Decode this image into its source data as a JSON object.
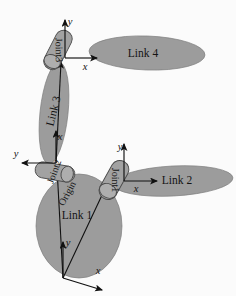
{
  "figure": {
    "kind": "kinematic-chain-diagram",
    "background_color": "#fbfbfb",
    "body_fill_color": "#9c9c9c",
    "joint_fill_color": "#a2a2a2",
    "outline_color": "#4a4a4a",
    "text_color": "#141414"
  },
  "links": [
    {
      "id": "link1",
      "label": "Link 1",
      "shape": "ellipse",
      "cx": 79,
      "cy": 226,
      "rx": 43,
      "ry": 52,
      "rotation": 0,
      "label_x": 77,
      "label_y": 219,
      "label_rotation": 0
    },
    {
      "id": "link2",
      "label": "Link 2",
      "shape": "ellipse",
      "cx": 173,
      "cy": 181,
      "rx": 60,
      "ry": 15,
      "rotation": -3,
      "label_x": 177,
      "label_y": 184,
      "label_rotation": 0
    },
    {
      "id": "link3",
      "label": "Link 3",
      "shape": "ellipse",
      "cx": 54,
      "cy": 113,
      "rx": 14,
      "ry": 51,
      "rotation": 6,
      "label_x": 57,
      "label_y": 112,
      "label_rotation": -76
    },
    {
      "id": "link4",
      "label": "Link 4",
      "shape": "ellipse",
      "cx": 147,
      "cy": 53,
      "rx": 58,
      "ry": 17,
      "rotation": 2,
      "label_x": 143,
      "label_y": 57,
      "label_rotation": 0
    }
  ],
  "joints": [
    {
      "id": "joint1",
      "label": "Joint1",
      "cx": 114,
      "cy": 180,
      "width": 18,
      "height": 42,
      "rotation": 29,
      "label_rotation": 61
    },
    {
      "id": "joint2",
      "label": "Joint2",
      "cx": 55,
      "cy": 172,
      "width": 16,
      "height": 40,
      "rotation": -80,
      "label_rotation": 10
    },
    {
      "id": "joint3",
      "label": "Joint3",
      "cx": 58,
      "cy": 50,
      "width": 17,
      "height": 42,
      "rotation": 27,
      "label_rotation": 62
    }
  ],
  "frames": [
    {
      "id": "base-frame",
      "origin_x": 63,
      "origin_y": 278,
      "x_axis": {
        "label": "x",
        "dx": 39,
        "dy": 12,
        "label_x": 98,
        "label_y": 274
      },
      "y_axis": {
        "label": "y",
        "dx": 0,
        "dy": -36,
        "label_x": 68,
        "label_y": 246
      }
    },
    {
      "id": "joint1-frame",
      "origin_x": 124,
      "origin_y": 181,
      "x_axis": {
        "label": "x",
        "dx": 33,
        "dy": 0,
        "label_x": 136,
        "label_y": 192
      },
      "y_axis": {
        "label": "y",
        "dx": 0,
        "dy": -37,
        "label_x": 120,
        "label_y": 150
      }
    },
    {
      "id": "joint2-frame",
      "origin_x": 56,
      "origin_y": 163,
      "x_axis": {
        "label": "x",
        "dx": 0,
        "dy": -32,
        "label_x": 60,
        "label_y": 140
      },
      "y_axis": {
        "label": "y",
        "dx": -34,
        "dy": 0,
        "label_x": 16,
        "label_y": 157
      }
    },
    {
      "id": "joint3-frame",
      "origin_x": 65,
      "origin_y": 58,
      "x_axis": {
        "label": "x",
        "dx": 32,
        "dy": 0,
        "label_x": 85,
        "label_y": 70
      },
      "y_axis": {
        "label": "y",
        "dx": 0,
        "dy": -38,
        "label_x": 70,
        "label_y": 25
      }
    }
  ],
  "connectors": [
    {
      "id": "origin-to-joint2",
      "x1": 63,
      "y1": 278,
      "x2": 57,
      "y2": 168
    },
    {
      "id": "origin-to-joint1",
      "x1": 63,
      "y1": 278,
      "x2": 111,
      "y2": 176
    },
    {
      "id": "joint2-to-joint3",
      "x1": 56,
      "y1": 163,
      "x2": 61,
      "y2": 62
    }
  ],
  "annotations": [
    {
      "id": "origin-label",
      "label": "Origin",
      "x": 70,
      "y": 195,
      "rotation": -62
    }
  ]
}
